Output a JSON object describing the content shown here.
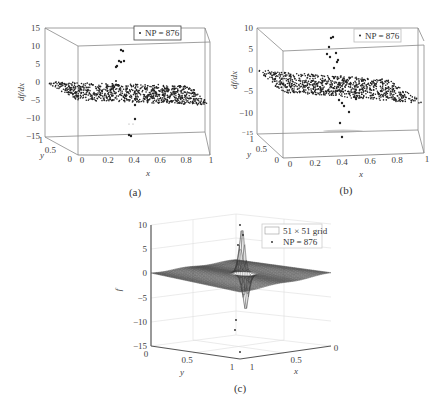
{
  "chart_data": [
    {
      "id": "a",
      "type": "scatter",
      "projection": "3d",
      "caption": "(a)",
      "xlabel": "x",
      "ylabel": "y",
      "zlabel": "df/dx",
      "xticks": [
        "0",
        "0.2",
        "0.4",
        "0.6",
        "0.8",
        "1"
      ],
      "yticks": [
        "0",
        "0.5",
        "1"
      ],
      "zticks": [
        "15",
        "10",
        "5",
        "0",
        "-5",
        "-10",
        "-15"
      ],
      "zlim": [
        -15,
        15
      ],
      "xlim": [
        0,
        1
      ],
      "ylim": [
        0,
        1
      ],
      "legend": [
        {
          "marker": "dot",
          "label": "NP = 876"
        }
      ],
      "legend_position": "upper right",
      "series": [
        {
          "name": "NP = 876",
          "n_points": 876,
          "description": "Scattered points mostly on a slightly tilted plane around df/dx ≈ -2 to -5, with outliers near x≈0.35–0.4 reaching ≈ +9 and ≈ -15"
        }
      ],
      "outliers_approx": [
        {
          "x": 0.35,
          "z": 9
        },
        {
          "x": 0.36,
          "z": 8.5
        },
        {
          "x": 0.33,
          "z": 6
        },
        {
          "x": 0.35,
          "z": 5.5
        },
        {
          "x": 0.37,
          "z": 6
        },
        {
          "x": 0.32,
          "z": 4.5
        },
        {
          "x": 0.42,
          "z": -6
        },
        {
          "x": 0.43,
          "z": -10
        },
        {
          "x": 0.4,
          "z": -15
        }
      ]
    },
    {
      "id": "b",
      "type": "scatter",
      "projection": "3d",
      "caption": "(b)",
      "xlabel": "x",
      "ylabel": "y",
      "zlabel": "df/dx",
      "xticks": [
        "0",
        "0.2",
        "0.4",
        "0.6",
        "0.8",
        "1"
      ],
      "yticks": [
        "0",
        "0.5",
        "1"
      ],
      "zticks": [
        "10",
        "5",
        "0",
        "-5",
        "-10",
        "-15"
      ],
      "zlim": [
        -15,
        10
      ],
      "xlim": [
        0,
        1
      ],
      "ylim": [
        0,
        1
      ],
      "legend": [
        {
          "marker": "dot",
          "label": "NP = 876"
        }
      ],
      "legend_position": "upper right",
      "series": [
        {
          "name": "NP = 876",
          "n_points": 876,
          "description": "Scattered points on a tilted plane around df/dx ≈ -2 to -5; a vertical column of outliers near x≈0.35–0.45 spanning from ≈ +8 down to ≈ -15"
        }
      ],
      "outliers_approx": [
        {
          "x": 0.36,
          "z": 8
        },
        {
          "x": 0.35,
          "z": 7.5
        },
        {
          "x": 0.33,
          "z": 5
        },
        {
          "x": 0.31,
          "z": 3
        },
        {
          "x": 0.34,
          "z": 2
        },
        {
          "x": 0.36,
          "z": 1
        },
        {
          "x": 0.33,
          "z": 0
        },
        {
          "x": 0.4,
          "z": -6
        },
        {
          "x": 0.41,
          "z": -7
        },
        {
          "x": 0.45,
          "z": -9
        },
        {
          "x": 0.38,
          "z": -12
        },
        {
          "x": 0.4,
          "z": -15
        }
      ]
    },
    {
      "id": "c",
      "type": "surface",
      "projection": "3d",
      "caption": "(c)",
      "xlabel": "x",
      "ylabel": "y",
      "zlabel": "f",
      "xticks": [
        "0",
        "0.5",
        "1"
      ],
      "yticks": [
        "0",
        "0.5",
        "1"
      ],
      "zticks": [
        "10",
        "5",
        "0",
        "-5",
        "-10",
        "-15"
      ],
      "zlim": [
        -15,
        10
      ],
      "xlim": [
        0,
        1
      ],
      "ylim": [
        0,
        1
      ],
      "grid": true,
      "legend": [
        {
          "marker": "box",
          "label": "51 × 51 grid"
        },
        {
          "marker": "dot",
          "label": "NP = 876"
        }
      ],
      "legend_position": "upper right",
      "series": [
        {
          "name": "51 × 51 grid",
          "type": "surface",
          "grid_size": [
            51,
            51
          ],
          "description": "Mostly flat mesh surface around f ≈ -3 to 0, with a sharp positive spike to ≈ +10 and negative dip to ≈ -12 near the center"
        },
        {
          "name": "NP = 876",
          "type": "scatter",
          "n_points": 876
        }
      ],
      "peaks_approx": [
        {
          "label": "max",
          "z": 10
        },
        {
          "label": "min",
          "z": -12
        }
      ]
    }
  ],
  "captions": {
    "a": "(a)",
    "b": "(b)",
    "c": "(c)"
  },
  "legends": {
    "a": "NP = 876",
    "b": "NP = 876",
    "c_grid": "51 × 51 grid",
    "c_points": "NP = 876"
  }
}
